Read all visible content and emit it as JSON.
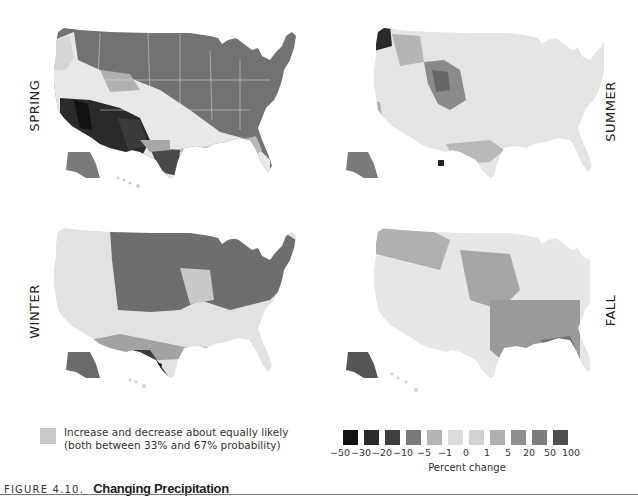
{
  "panels": {
    "spring": {
      "label": "SPRING"
    },
    "summer": {
      "label": "SUMMER"
    },
    "winter": {
      "label": "WINTER"
    },
    "fall": {
      "label": "FALL"
    }
  },
  "legend_equal": {
    "color": "#c9c9c9",
    "line1": "Increase and decrease about equally likely",
    "line2": "(both between 33% and 67% probability)"
  },
  "scale": {
    "title": "Percent change",
    "ticks": [
      "−50",
      "−30",
      "−20",
      "−10",
      "−5",
      "−1",
      "0",
      "1",
      "5",
      "20",
      "50",
      "100"
    ],
    "swatch_colors": [
      "#111111",
      "#2a2a2a",
      "#3e3e3e",
      "#7a7a7a",
      "#b4b4b4",
      "#dcdcdc",
      "#d2d2d2",
      "#b0b0b0",
      "#8e8e8e",
      "#7c7c7c",
      "#4e4e4e"
    ]
  },
  "caption": {
    "figure_number": "FIGURE 4.10.",
    "title": "Changing Precipitation"
  },
  "chart_data": {
    "type": "heatmap",
    "title": "Changing Precipitation",
    "subtitle": "FIGURE 4.10.",
    "panels": [
      "SPRING",
      "SUMMER",
      "WINTER",
      "FALL"
    ],
    "legend": {
      "label": "Percent change",
      "bin_edges": [
        -50,
        -30,
        -20,
        -10,
        -5,
        -1,
        0,
        1,
        5,
        20,
        50,
        100
      ],
      "no_consensus": "Increase and decrease about equally likely (both between 33% and 67% probability)"
    },
    "regional_summary": {
      "SPRING": {
        "north_and_east": "increase (~5 to 20)",
        "southwest": "decrease (-20 to -50)",
        "south_texas": "decrease (-10 to -30)",
        "central_band": "equally likely",
        "alaska": "increase"
      },
      "SUMMER": {
        "pacific_northwest": "decrease (-20 to -50)",
        "northern_plains": "increase (1 to 20)",
        "most_of_country": "equally likely",
        "florida": "decrease",
        "alaska": "increase"
      },
      "WINTER": {
        "north_and_northeast": "increase (5 to 20)",
        "southern_band": "decrease (-5 to -10)",
        "south_texas": "decrease (-20 to -50)",
        "central_band": "equally likely",
        "alaska": "increase"
      },
      "FALL": {
        "southeast": "increase (1 to 20)",
        "california_coast": "increase/decrease strong",
        "interior_west": "equally likely",
        "alaska": "increase"
      }
    }
  }
}
